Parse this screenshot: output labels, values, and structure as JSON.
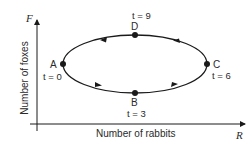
{
  "diagram": {
    "type": "phase-plane-cycle",
    "x_axis": {
      "label": "Number of rabbits",
      "symbol": "R"
    },
    "y_axis": {
      "label": "Number of foxes",
      "symbol": "F"
    },
    "points": [
      {
        "id": "A",
        "label": "A",
        "time": "t = 0"
      },
      {
        "id": "B",
        "label": "B",
        "time": "t = 3"
      },
      {
        "id": "C",
        "label": "C",
        "time": "t = 6"
      },
      {
        "id": "D",
        "label": "D",
        "time": "t = 9"
      }
    ],
    "direction": "counterclockwise (A → B → C → D → A)",
    "colors": {
      "line": "#1a1a1a",
      "background": "#ffffff"
    }
  }
}
